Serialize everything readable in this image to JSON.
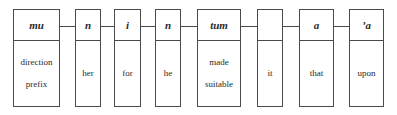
{
  "diagram": {
    "type": "morpheme-gloss",
    "morphemes": [
      {
        "form": "mu",
        "gloss": [
          "direction",
          "prefix"
        ]
      },
      {
        "form": "n",
        "gloss": [
          "her"
        ]
      },
      {
        "form": "i",
        "gloss": [
          "for"
        ]
      },
      {
        "form": "n",
        "gloss": [
          "he"
        ]
      },
      {
        "form": "tum",
        "gloss": [
          "made",
          "suitable"
        ]
      },
      {
        "form": "",
        "gloss": [
          "it"
        ]
      },
      {
        "form": "a",
        "gloss": [
          "that"
        ]
      },
      {
        "form": "’a",
        "gloss": [
          "upon"
        ]
      }
    ]
  }
}
